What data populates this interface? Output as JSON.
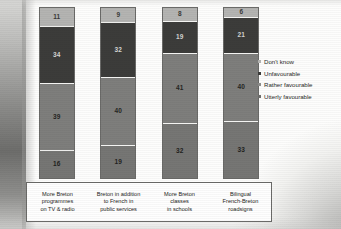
{
  "chart_data": {
    "type": "bar",
    "subtype": "stacked-bar-100",
    "title": "",
    "xlabel": "",
    "ylabel": "",
    "ylim": [
      0,
      100
    ],
    "grid": false,
    "legend_position": "right",
    "categories": [
      "More Breton programmes on TV & radio",
      "Breton in addition to French in public services",
      "More Breton classes in schools",
      "Bilingual French-Breton roadsigns"
    ],
    "category_lines": [
      [
        "More Breton",
        "programmes",
        "on TV & radio"
      ],
      [
        "Breton in addition",
        "to French in",
        "public services"
      ],
      [
        "More Breton",
        "classes",
        "in schools"
      ],
      [
        "Bilingual",
        "French-Breton",
        "roadsigns"
      ]
    ],
    "series": [
      {
        "name": "Don't know",
        "color": "#b4b4b2",
        "values": [
          11,
          9,
          8,
          6
        ]
      },
      {
        "name": "Unfavourable",
        "color": "#3c3c3a",
        "values": [
          34,
          32,
          19,
          21
        ]
      },
      {
        "name": "Rather favourable",
        "color": "#7e7e7c",
        "values": [
          39,
          40,
          41,
          40
        ]
      },
      {
        "name": "Utterly favourable",
        "color": "#767674",
        "values": [
          16,
          19,
          32,
          33
        ]
      }
    ]
  },
  "legend": {
    "items": [
      {
        "label": "Don't know",
        "color": "#b4b4b2"
      },
      {
        "label": "Unfavourable",
        "color": "#3c3c3a"
      },
      {
        "label": "Rather favourable",
        "color": "#8d8d8b"
      },
      {
        "label": "Utterly favourable",
        "color": "#6e6e6c"
      }
    ]
  }
}
